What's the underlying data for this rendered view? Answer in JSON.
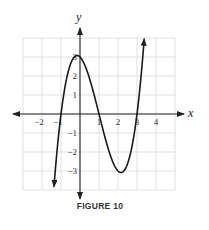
{
  "figure": {
    "caption": "FIGURE 10"
  },
  "chart_data": {
    "type": "line",
    "title": "",
    "caption": "FIGURE 10",
    "function": "f(x) = x^3 - 3x^2 - x + 3",
    "xlabel": "x",
    "ylabel": "y",
    "xlim": [
      -3,
      5
    ],
    "ylim": [
      -4,
      4
    ],
    "grid": true,
    "x_ticks": [
      -2,
      -1,
      1,
      2,
      3,
      4
    ],
    "x_tick_labels": [
      "−2",
      "−1",
      "1",
      "2",
      "3",
      "4"
    ],
    "y_ticks": [
      3,
      2,
      1,
      -1,
      -2,
      -3
    ],
    "y_tick_labels": [
      "3",
      "2",
      "1",
      "−1",
      "−2",
      "−3"
    ],
    "x_intercepts": [
      -1,
      1,
      3
    ],
    "y_intercept": 3,
    "local_max": {
      "x": -0.15,
      "y": 3.08
    },
    "local_min": {
      "x": 2.15,
      "y": -3.08
    },
    "series": [
      {
        "name": "f(x)",
        "x": [
          -1.37,
          -1.2,
          -1.0,
          -0.75,
          -0.5,
          -0.25,
          0,
          0.25,
          0.5,
          0.75,
          1.0,
          1.25,
          1.5,
          1.75,
          2.0,
          2.25,
          2.5,
          2.75,
          3.0,
          3.2,
          3.38
        ],
        "y": [
          -3.83,
          -1.85,
          0,
          1.64,
          2.63,
          3.05,
          3.0,
          2.58,
          1.88,
          0.98,
          0,
          -0.98,
          -1.88,
          -2.58,
          -3.0,
          -3.05,
          -2.63,
          -1.64,
          0,
          1.85,
          4.0
        ]
      }
    ],
    "end_arrows": true
  }
}
